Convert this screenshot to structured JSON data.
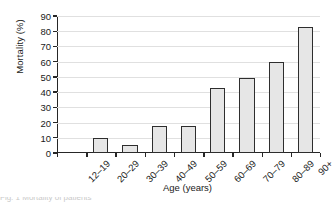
{
  "chart_data": {
    "type": "bar",
    "title": "",
    "subtitle": "",
    "xlabel": "Age (years)",
    "ylabel": "Mortality (%)",
    "categories": [
      "12–19",
      "20–29",
      "30–39",
      "40–49",
      "50–59",
      "60–69",
      "70–79",
      "80–89",
      "90+"
    ],
    "values": [
      0,
      10,
      5,
      18,
      18,
      43,
      49,
      60,
      83
    ],
    "series": [
      {
        "name": "Mortality",
        "values": [
          0,
          10,
          5,
          18,
          18,
          43,
          49,
          60,
          83
        ]
      }
    ],
    "ylim": [
      0,
      90
    ],
    "yticks": [
      0,
      10,
      20,
      30,
      40,
      50,
      60,
      70,
      80,
      90
    ],
    "ytick_labels": [
      "0",
      "10",
      "20",
      "30",
      "40",
      "50",
      "60",
      "70",
      "80",
      "90"
    ],
    "xlim_categories": 9,
    "grid": "horizontal",
    "legend": "none",
    "bar_fill_color": "#e6e6e6",
    "bar_edge_color": "#2e2e2e",
    "gridline_color": "#e0e0e0",
    "axis_color": "#262626",
    "background_color": "#ffffff",
    "xtick_label_rotation": -45,
    "annotations": []
  },
  "caption": {
    "cropped_text": "Fig. 1 Mortality of patients"
  }
}
